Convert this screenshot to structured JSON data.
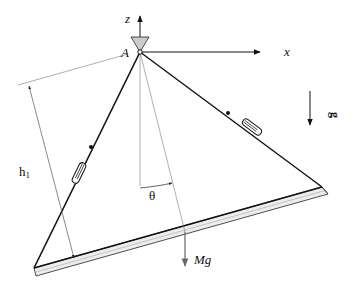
{
  "diagram": {
    "labels": {
      "pivot": "A",
      "z_axis": "z",
      "x_axis": "x",
      "gravity": "g",
      "height": "h",
      "height_sub": "1",
      "angle": "θ",
      "weight": "Mg"
    },
    "colors": {
      "ink": "#111111",
      "thin": "#555555",
      "plate_fill": "#e8e8e8",
      "support_fill": "#cccccc",
      "weight_arrow": "#666666"
    }
  }
}
